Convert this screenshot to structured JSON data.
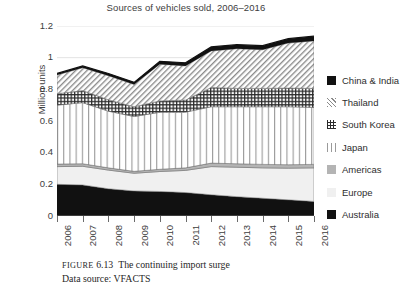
{
  "chart_data": {
    "type": "area",
    "title": "Sources of vehicles sold, 2006–2016",
    "xlabel": "",
    "ylabel": "Million units",
    "ylim": [
      0,
      1.2
    ],
    "yticks": [
      "0",
      "0.2",
      "0.4",
      "0.6",
      "0.8",
      "1",
      "1.2"
    ],
    "ytick_values": [
      0,
      0.2,
      0.4,
      0.6,
      0.8,
      1.0,
      1.2
    ],
    "grid": "horizontal-light",
    "legend_position": "right",
    "stacked": true,
    "categories": [
      "2006",
      "2007",
      "2008",
      "2009",
      "2010",
      "2011",
      "2012",
      "2013",
      "2014",
      "2015",
      "2016"
    ],
    "series": [
      {
        "name": "Australia",
        "fill": "solid-black",
        "values": [
          0.2,
          0.196,
          0.172,
          0.158,
          0.155,
          0.148,
          0.134,
          0.122,
          0.112,
          0.102,
          0.092
        ]
      },
      {
        "name": "Europe",
        "fill": "light-gray",
        "values": [
          0.112,
          0.118,
          0.118,
          0.112,
          0.126,
          0.14,
          0.178,
          0.186,
          0.192,
          0.2,
          0.212
        ]
      },
      {
        "name": "Americas",
        "fill": "gray",
        "values": [
          0.016,
          0.016,
          0.014,
          0.012,
          0.014,
          0.016,
          0.022,
          0.022,
          0.022,
          0.022,
          0.022
        ]
      },
      {
        "name": "Japan",
        "fill": "vertical-lines",
        "values": [
          0.372,
          0.386,
          0.358,
          0.346,
          0.36,
          0.352,
          0.356,
          0.36,
          0.364,
          0.366,
          0.36
        ]
      },
      {
        "name": "South Korea",
        "fill": "checkerboard",
        "values": [
          0.072,
          0.076,
          0.072,
          0.062,
          0.072,
          0.076,
          0.122,
          0.116,
          0.116,
          0.118,
          0.12
        ]
      },
      {
        "name": "Thailand",
        "fill": "diagonal-hatch",
        "values": [
          0.118,
          0.144,
          0.152,
          0.14,
          0.232,
          0.216,
          0.23,
          0.25,
          0.244,
          0.284,
          0.3
        ]
      },
      {
        "name": "China & India",
        "fill": "solid-black",
        "values": [
          0.01,
          0.012,
          0.014,
          0.014,
          0.018,
          0.02,
          0.026,
          0.026,
          0.026,
          0.028,
          0.03
        ]
      }
    ],
    "totals": [
      0.9,
      0.948,
      0.9,
      0.844,
      0.977,
      0.968,
      1.068,
      1.082,
      1.076,
      1.12,
      1.136
    ],
    "annotations": []
  },
  "legend": {
    "items": [
      {
        "label": "China & India",
        "swatch": "solid-black-swatch",
        "color": "#111111"
      },
      {
        "label": "Thailand",
        "swatch": "diagonal-hatch-swatch",
        "color": "#8a8a8a"
      },
      {
        "label": "South Korea",
        "swatch": "checkerboard-swatch",
        "color": "#2b2b2b"
      },
      {
        "label": "Japan",
        "swatch": "vertical-lines-swatch",
        "color": "#9a9a9a"
      },
      {
        "label": "Americas",
        "swatch": "gray-swatch",
        "color": "#b4b4b4"
      },
      {
        "label": "Europe",
        "swatch": "light-gray-swatch",
        "color": "#f0f0f0"
      },
      {
        "label": "Australia",
        "swatch": "solid-black-swatch",
        "color": "#111111"
      }
    ]
  },
  "caption": {
    "figure_label": "FIGURE",
    "figure_number": "6.13",
    "title": "The continuing import surge",
    "source": "Data source: VFACTS"
  }
}
